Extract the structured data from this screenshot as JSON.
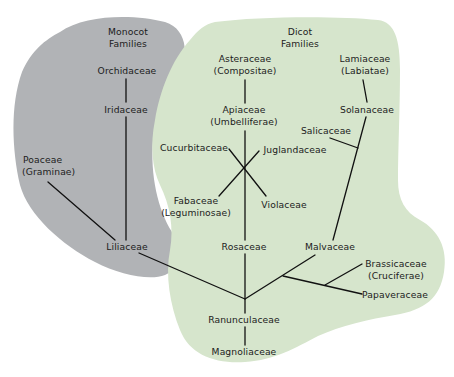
{
  "colors": {
    "monocot_region": "#b1b3b6",
    "dicot_region": "#d6e5cc",
    "line": "#111111",
    "text": "#1c1c1c"
  },
  "regions": {
    "monocot": {
      "title_line1": "Monocot",
      "title_line2": "Families"
    },
    "dicot": {
      "title_line1": "Dicot",
      "title_line2": "Families"
    }
  },
  "nodes": {
    "orchidaceae": {
      "name": "Orchidaceae"
    },
    "iridaceae": {
      "name": "Iridaceae"
    },
    "poaceae": {
      "name": "Poaceae",
      "alt": "(Graminae)"
    },
    "liliaceae": {
      "name": "Liliaceae"
    },
    "asteraceae": {
      "name": "Asteraceae",
      "alt": "(Compositae)"
    },
    "apiaceae": {
      "name": "Apiaceae",
      "alt": "(Umbelliferae)"
    },
    "lamiaceae": {
      "name": "Lamiaceae",
      "alt": "(Labiatae)"
    },
    "solanaceae": {
      "name": "Solanaceae"
    },
    "salicaceae": {
      "name": "Salicaceae"
    },
    "cucurbitaceae": {
      "name": "Cucurbitaceae"
    },
    "juglandaceae": {
      "name": "Juglandaceae"
    },
    "fabaceae": {
      "name": "Fabaceae",
      "alt": "(Leguminosae)"
    },
    "violaceae": {
      "name": "Violaceae"
    },
    "rosaceae": {
      "name": "Rosaceae"
    },
    "malvaceae": {
      "name": "Malvaceae"
    },
    "brassicaceae": {
      "name": "Brassicaceae",
      "alt": "(Cruciferae)"
    },
    "papaveraceae": {
      "name": "Papaveraceae"
    },
    "ranunculaceae": {
      "name": "Ranunculaceae"
    },
    "magnoliaceae": {
      "name": "Magnoliaceae"
    }
  },
  "edges": [
    [
      "orchidaceae",
      "iridaceae"
    ],
    [
      "iridaceae",
      "liliaceae"
    ],
    [
      "poaceae",
      "liliaceae"
    ],
    [
      "liliaceae",
      "ranunculaceae"
    ],
    [
      "asteraceae",
      "apiaceae"
    ],
    [
      "apiaceae",
      "rosaceae"
    ],
    [
      "cucurbitaceae",
      "violaceae"
    ],
    [
      "juglandaceae",
      "fabaceae"
    ],
    [
      "rosaceae",
      "ranunculaceae"
    ],
    [
      "ranunculaceae",
      "malvaceae"
    ],
    [
      "malvaceae",
      "papaveraceae"
    ],
    [
      "papaveraceae",
      "brassicaceae"
    ],
    [
      "lamiaceae",
      "solanaceae"
    ],
    [
      "solanaceae",
      "malvaceae"
    ],
    [
      "salicaceae",
      "solanaceae"
    ],
    [
      "ranunculaceae",
      "magnoliaceae"
    ]
  ]
}
